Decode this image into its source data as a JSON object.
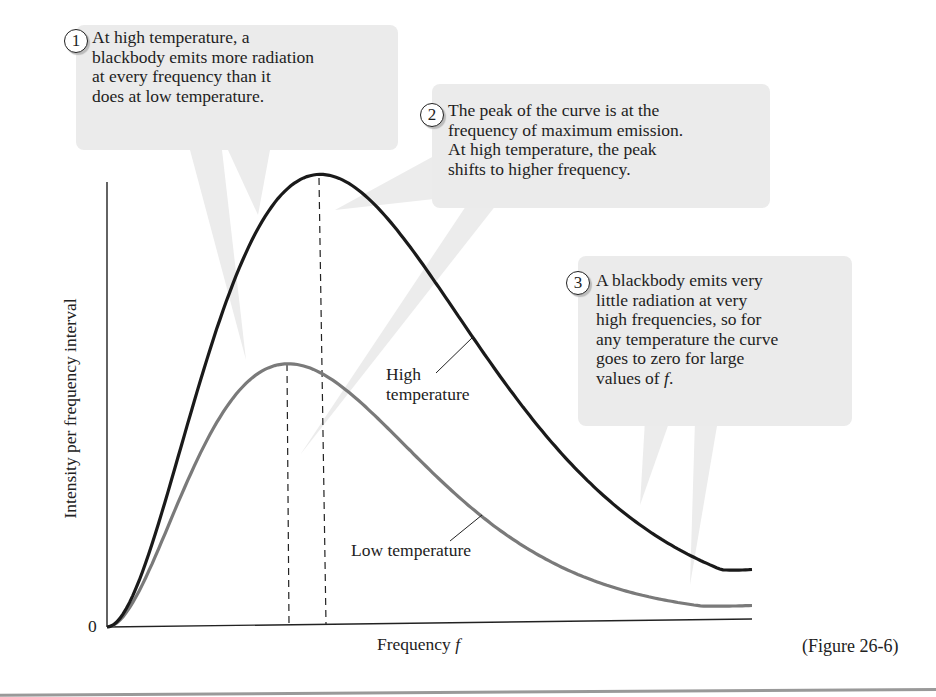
{
  "figure_label": "(Figure 26-6)",
  "callouts": [
    {
      "number": "1",
      "text": "At high temperature, a\nblackbody emits more radiation\nat every frequency than it\ndoes at low temperature."
    },
    {
      "number": "2",
      "text": "The peak of the curve is at the\nfrequency of maximum emission.\nAt high temperature, the peak\nshifts to higher frequency."
    },
    {
      "number": "3",
      "text": "A blackbody emits very\nlittle radiation at very\nhigh frequencies, so for\nany temperature the curve\ngoes to zero for large\nvalues of ",
      "italic_tail": "f",
      "tail_end": "."
    }
  ],
  "axes": {
    "ylabel": "Intensity per frequency interval",
    "xlabel": "Frequency ",
    "xlabel_var": "f",
    "origin_label": "0"
  },
  "curve_labels": {
    "high": "High\ntemperature",
    "low": "Low temperature"
  },
  "colors": {
    "high_curve": "#1a1a1a",
    "low_curve": "#7a7a7a",
    "callout_bg": "#ebebeb",
    "axis": "#222222"
  },
  "chart_data": {
    "type": "line",
    "xlabel": "Frequency f",
    "ylabel": "Intensity per frequency interval",
    "x_range": [
      0,
      10
    ],
    "y_range": [
      0,
      1.0
    ],
    "grid": false,
    "series": [
      {
        "name": "High temperature",
        "peak_x": 3.3,
        "peak_y": 1.0,
        "end_y": 0.11,
        "color": "#1a1a1a"
      },
      {
        "name": "Low temperature",
        "peak_x": 2.8,
        "peak_y": 0.58,
        "end_y": 0.03,
        "color": "#7a7a7a"
      }
    ],
    "annotations": [
      "dashed vertical lines mark peak frequency of each curve"
    ]
  }
}
